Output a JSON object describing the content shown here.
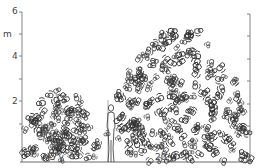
{
  "axis": {
    "unit": "m",
    "y_ticks": [
      "6",
      "4",
      "2"
    ],
    "y_range": [
      0,
      6
    ]
  },
  "trees": [
    {
      "label": "5 y",
      "height_m": 2.3
    },
    {
      "label": "20 y",
      "height_m": 5.2
    }
  ],
  "figure": {
    "type": "human-silhouette",
    "height_m": 1.8
  },
  "colors": {
    "ink": "#333333",
    "axis": "#666666"
  }
}
